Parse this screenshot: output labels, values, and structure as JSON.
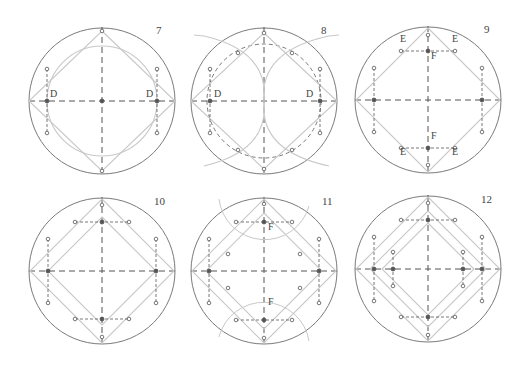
{
  "figure": {
    "colors": {
      "outer_circle": "#7a7a7a",
      "guide": "#c8c8c8",
      "dash": "#555555",
      "point": "#555555"
    },
    "radius": 73,
    "panels": [
      {
        "id": "7",
        "number": "7",
        "cx": 102,
        "cy": 101,
        "labels": [
          {
            "text": "D",
            "dx": -52,
            "dy": -3
          },
          {
            "text": "D",
            "dx": 44,
            "dy": -3
          }
        ]
      },
      {
        "id": "8",
        "number": "8",
        "cx": 264,
        "cy": 101,
        "labels": [
          {
            "text": "D",
            "dx": -50,
            "dy": -3
          },
          {
            "text": "D",
            "dx": 42,
            "dy": -3
          }
        ]
      },
      {
        "id": "9",
        "number": "9",
        "cx": 428,
        "cy": 100,
        "labels": [
          {
            "text": "E",
            "dx": -28,
            "dy": -57
          },
          {
            "text": "E",
            "dx": 24,
            "dy": -57
          },
          {
            "text": "F",
            "dx": 3,
            "dy": -40
          },
          {
            "text": "F",
            "dx": 3,
            "dy": 40
          },
          {
            "text": "E",
            "dx": -28,
            "dy": 56
          },
          {
            "text": "E",
            "dx": 24,
            "dy": 56
          }
        ]
      },
      {
        "id": "10",
        "number": "10",
        "cx": 102,
        "cy": 271,
        "labels": []
      },
      {
        "id": "11",
        "number": "11",
        "cx": 264,
        "cy": 271,
        "labels": [
          {
            "text": "F",
            "dx": 4,
            "dy": -40
          },
          {
            "text": "F",
            "dx": 4,
            "dy": 35
          }
        ]
      },
      {
        "id": "12",
        "number": "12",
        "cx": 428,
        "cy": 269,
        "labels": []
      }
    ]
  }
}
